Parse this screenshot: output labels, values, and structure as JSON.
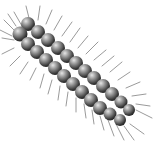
{
  "image": {
    "description": "Grayscale illustration of a bristly caterpillar with two rows of spherical segments, oriented diagonally from top-left to bottom-right",
    "subject": "caterpillar",
    "colors": {
      "background": "#ffffff",
      "segment_light": "#d9d9d9",
      "segment_mid": "#8a8a8a",
      "segment_dark": "#2a2a2a",
      "hair": "#7a7a7a"
    }
  }
}
